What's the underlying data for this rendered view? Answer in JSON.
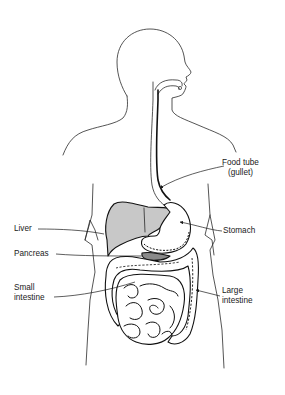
{
  "diagram": {
    "type": "anatomical-illustration",
    "colors": {
      "background": "#ffffff",
      "line": "#1a1a1a",
      "liver_fill": "#c8c8c8",
      "pancreas_fill": "#8a8a8a",
      "organ_fill": "#ffffff"
    },
    "labels": {
      "food_tube_line1": "Food tube",
      "food_tube_line2": "(gullet)",
      "liver": "Liver",
      "stomach": "Stomach",
      "pancreas": "Pancreas",
      "small_intestine_line1": "Small",
      "small_intestine_line2": "intestine",
      "large_intestine_line1": "Large",
      "large_intestine_line2": "intestine"
    }
  }
}
